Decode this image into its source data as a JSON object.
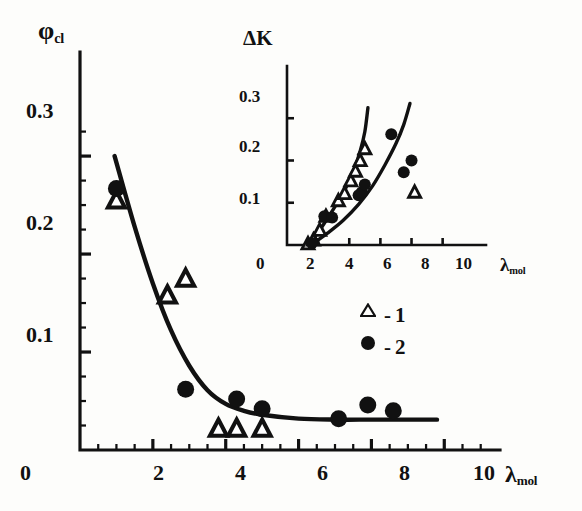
{
  "figure": {
    "background_color": "#fdfdfb",
    "ink_color": "#111111"
  },
  "main_chart": {
    "ylabel": "φ",
    "ylabel_sub": "cl",
    "xlabel": "λ",
    "xlabel_sub": "mol",
    "y_ticks": [
      "0.1",
      "0.2",
      "0.3"
    ],
    "x_ticks": [
      "0",
      "2",
      "4",
      "6",
      "8",
      "10"
    ],
    "legend": [
      {
        "symbol": "triangle",
        "dash": "-",
        "label": "1"
      },
      {
        "symbol": "circle",
        "dash": "-",
        "label": "2"
      }
    ]
  },
  "inset_chart": {
    "ylabel": "ΔK",
    "xlabel": "λ",
    "xlabel_sub": "mol",
    "y_ticks": [
      "0.1",
      "0.2",
      "0.3"
    ],
    "x_ticks": [
      "0",
      "2",
      "4",
      "6",
      "8",
      "10"
    ]
  },
  "chart_data": [
    {
      "id": "main",
      "type": "scatter",
      "title": "",
      "xlabel": "λ_mol",
      "ylabel": "φ_cl",
      "xlim": [
        0,
        11.2
      ],
      "ylim": [
        0,
        0.345
      ],
      "x_ticks": [
        0,
        2,
        4,
        6,
        8,
        10
      ],
      "y_ticks": [
        0.1,
        0.2,
        0.3
      ],
      "x_minor_step": 0.5,
      "y_minor_step": 0.025,
      "grid": false,
      "legend_position": "right-middle",
      "legend": [
        "1",
        "2"
      ],
      "series": [
        {
          "name": "1",
          "marker": "open-triangle",
          "points": [
            [
              1.0,
              0.255
            ],
            [
              2.4,
              0.158
            ],
            [
              2.9,
              0.175
            ],
            [
              3.8,
              0.022
            ],
            [
              4.3,
              0.022
            ],
            [
              5.0,
              0.022
            ]
          ]
        },
        {
          "name": "2",
          "marker": "filled-circle",
          "points": [
            [
              1.0,
              0.267
            ],
            [
              2.9,
              0.062
            ],
            [
              4.3,
              0.052
            ],
            [
              5.0,
              0.042
            ],
            [
              7.1,
              0.032
            ],
            [
              7.9,
              0.046
            ],
            [
              8.6,
              0.04
            ]
          ]
        }
      ],
      "curves": [
        {
          "name": "fit",
          "points": [
            [
              0.95,
              0.3
            ],
            [
              1.5,
              0.228
            ],
            [
              2.0,
              0.17
            ],
            [
              2.5,
              0.122
            ],
            [
              3.0,
              0.086
            ],
            [
              3.5,
              0.061
            ],
            [
              4.0,
              0.047
            ],
            [
              4.5,
              0.04
            ],
            [
              5.0,
              0.036
            ],
            [
              6.0,
              0.032
            ],
            [
              7.0,
              0.031
            ],
            [
              8.0,
              0.031
            ],
            [
              9.0,
              0.031
            ],
            [
              9.8,
              0.031
            ]
          ]
        }
      ]
    },
    {
      "id": "inset",
      "type": "scatter",
      "title": "",
      "xlabel": "λ_mol",
      "ylabel": "ΔK",
      "xlim": [
        0,
        11.5
      ],
      "ylim": [
        0,
        0.355
      ],
      "x_ticks": [
        0,
        2,
        4,
        6,
        8,
        10
      ],
      "y_ticks": [
        0.1,
        0.2,
        0.3
      ],
      "grid": false,
      "series": [
        {
          "name": "1",
          "marker": "open-triangle",
          "points": [
            [
              1.35,
              0.003
            ],
            [
              1.7,
              0.012
            ],
            [
              2.1,
              0.035
            ],
            [
              2.5,
              0.068
            ],
            [
              3.3,
              0.105
            ],
            [
              3.7,
              0.122
            ],
            [
              4.1,
              0.152
            ],
            [
              4.4,
              0.175
            ],
            [
              4.7,
              0.2
            ],
            [
              5.0,
              0.228
            ],
            [
              8.2,
              0.125
            ]
          ]
        },
        {
          "name": "2",
          "marker": "filled-circle",
          "points": [
            [
              1.6,
              0.005
            ],
            [
              2.4,
              0.068
            ],
            [
              2.9,
              0.065
            ],
            [
              4.6,
              0.118
            ],
            [
              4.8,
              0.125
            ],
            [
              5.0,
              0.143
            ],
            [
              6.7,
              0.262
            ],
            [
              7.5,
              0.172
            ],
            [
              8.0,
              0.2
            ]
          ]
        }
      ],
      "curves": [
        {
          "name": "curve-1",
          "points": [
            [
              1.35,
              0.0
            ],
            [
              2.0,
              0.03
            ],
            [
              2.6,
              0.063
            ],
            [
              3.2,
              0.098
            ],
            [
              3.8,
              0.137
            ],
            [
              4.3,
              0.178
            ],
            [
              4.7,
              0.222
            ],
            [
              5.0,
              0.268
            ],
            [
              5.2,
              0.325
            ]
          ]
        },
        {
          "name": "curve-2",
          "points": [
            [
              1.55,
              0.0
            ],
            [
              2.6,
              0.028
            ],
            [
              3.6,
              0.058
            ],
            [
              4.6,
              0.096
            ],
            [
              5.5,
              0.14
            ],
            [
              6.3,
              0.19
            ],
            [
              7.0,
              0.24
            ],
            [
              7.5,
              0.285
            ],
            [
              7.9,
              0.335
            ]
          ]
        }
      ]
    }
  ]
}
